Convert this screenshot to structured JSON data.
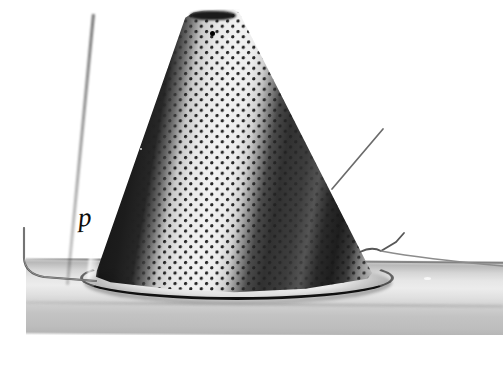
{
  "figure": {
    "kind": "photograph",
    "color_mode": "grayscale",
    "background_color": "#ffffff",
    "width_px": 503,
    "height_px": 365
  },
  "annotations": {
    "label_p": "p"
  },
  "objects": {
    "cone": {
      "name": "perforated-cone",
      "apex_color": "#1a1a1a",
      "highlight_color": "#f2f2f2",
      "shadow_color": "#141414"
    },
    "tube": {
      "name": "support-tube",
      "surface_color": "#e6e6e6",
      "shadow_color": "#b6b6b6"
    },
    "rim": {
      "name": "cone-base-rim",
      "color": "#111111"
    },
    "wires": {
      "name": "wire-filaments",
      "color": "#3a3a3a",
      "count": "3"
    }
  }
}
